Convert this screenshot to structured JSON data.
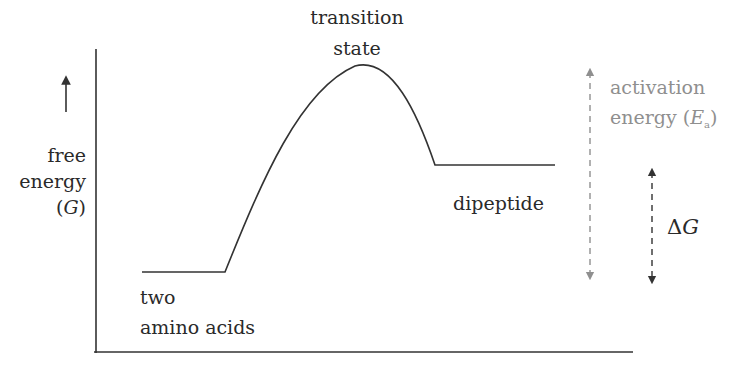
{
  "diagram": {
    "type": "reaction-energy-profile",
    "y_axis": {
      "label_line1": "free",
      "label_line2": "energy",
      "label_line3_open": "(",
      "label_line3_var": "G",
      "label_line3_close": ")",
      "direction_arrow": "up"
    },
    "x_axis": {
      "label": ""
    },
    "states": {
      "reactants": {
        "line1": "two",
        "line2": "amino acids",
        "relative_level": "low"
      },
      "transition": {
        "line1": "transition",
        "line2": "state",
        "relative_level": "peak"
      },
      "products": {
        "label": "dipeptide",
        "relative_level": "intermediate"
      }
    },
    "annotations": {
      "activation_energy": {
        "line1": "activation",
        "line2_prefix": "energy (",
        "line2_var": "E",
        "line2_sub": "a",
        "line2_suffix": ")",
        "color": "#8f8f8f",
        "style": "dashed double-headed arrow"
      },
      "delta_g": {
        "symbol": "Δ",
        "var": "G",
        "color": "#333333",
        "style": "dashed double-headed arrow"
      }
    },
    "colors": {
      "curve": "#333333",
      "axes": "#333333",
      "text": "#2a2a2a",
      "muted": "#8f8f8f",
      "background": "#ffffff"
    }
  }
}
